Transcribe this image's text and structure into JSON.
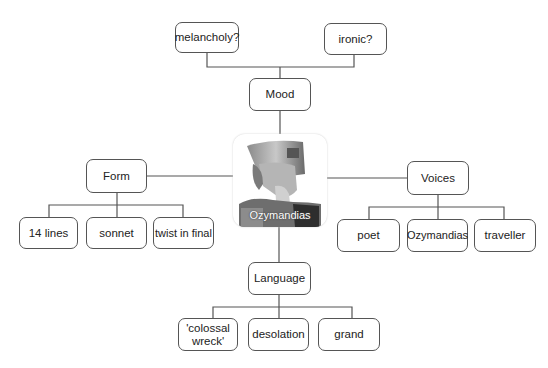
{
  "diagram": {
    "title": "Ozymandias",
    "center": {
      "label": "Ozymandias",
      "image": "pharaoh-bust-statue"
    },
    "branches": {
      "mood": {
        "label": "Mood",
        "children": [
          "melancholy?",
          "ironic?"
        ]
      },
      "form": {
        "label": "Form",
        "children": [
          "14 lines",
          "sonnet",
          "twist in final"
        ]
      },
      "voices": {
        "label": "Voices",
        "children": [
          "poet",
          "Ozymandias",
          "traveller"
        ]
      },
      "language": {
        "label": "Language",
        "children": [
          "'colossal wreck'",
          "desolation",
          "grand"
        ]
      }
    },
    "colors": {
      "line": "#555555",
      "border": "#555555",
      "text": "#222222",
      "background": "#ffffff"
    }
  }
}
